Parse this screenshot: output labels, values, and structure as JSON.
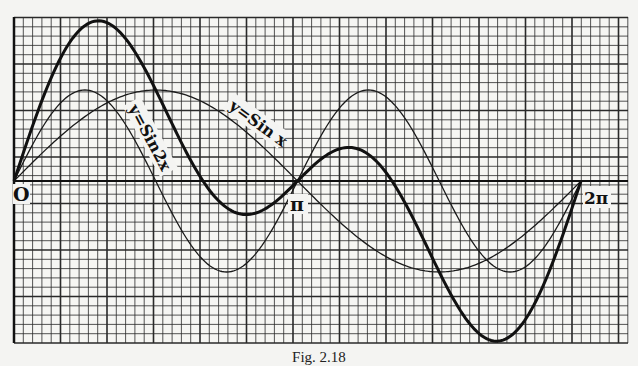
{
  "chart_data": {
    "type": "line",
    "title": "",
    "xlabel": "",
    "ylabel": "",
    "x_range": [
      0,
      6.2832
    ],
    "y_range": [
      -1.76,
      1.76
    ],
    "grid": true,
    "x_tick_labels": [
      {
        "x": 0,
        "label": "O"
      },
      {
        "x": 3.1416,
        "label": "π"
      },
      {
        "x": 6.2832,
        "label": "2π"
      }
    ],
    "series": [
      {
        "name": "y=Sin x",
        "expression": "sin(x)",
        "style": "thin",
        "peak": {
          "x": 1.5708,
          "y": 1.0
        },
        "trough": {
          "x": 4.7124,
          "y": -1.0
        }
      },
      {
        "name": "y=Sin2x",
        "expression": "sin(2x)",
        "style": "thin",
        "peak": {
          "x": 0.7854,
          "y": 1.0
        },
        "trough": {
          "x": 2.3562,
          "y": -1.0
        }
      },
      {
        "name": "y=Sin x + Sin2x",
        "expression": "sin(x)+sin(2x)",
        "style": "thick",
        "peak": {
          "x": 0.94,
          "y": 1.76
        },
        "trough": {
          "x": 5.34,
          "y": -1.76
        }
      }
    ],
    "annotations": [
      {
        "text": "y=Sin2x",
        "curve": "sin(2x)"
      },
      {
        "text": "y=Sin x",
        "curve": "sin(x)"
      }
    ]
  },
  "labels": {
    "origin": "O",
    "pi": "π",
    "two_pi": "2π",
    "sin2x": "y=Sin2x",
    "sinx": "y=Sin x"
  },
  "caption": "Fig. 2.18"
}
